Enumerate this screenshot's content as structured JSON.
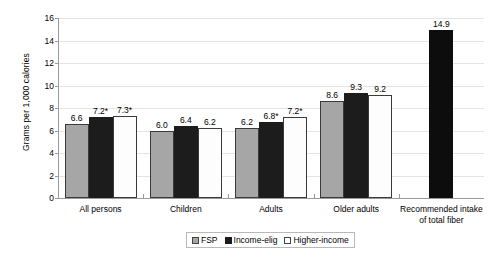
{
  "chart_data": {
    "type": "bar",
    "title": "",
    "xlabel": "",
    "ylabel": "Grams per 1,000 calories",
    "ylim": [
      0,
      16
    ],
    "yticks": [
      0,
      2,
      4,
      6,
      8,
      10,
      12,
      14,
      16
    ],
    "grid": true,
    "legend_position": "bottom-center",
    "categories": [
      "All persons",
      "Children",
      "Adults",
      "Older adults",
      "Recommended intake of total fiber"
    ],
    "series": [
      {
        "name": "FSP",
        "color": "#a6a6a6",
        "values": [
          6.6,
          6.0,
          6.2,
          8.6,
          null
        ],
        "labels": [
          "6.6",
          "6.0",
          "6.2",
          "8.6",
          ""
        ]
      },
      {
        "name": "Income-elig",
        "color": "#1c1c1c",
        "values": [
          7.2,
          6.4,
          6.8,
          9.3,
          null
        ],
        "labels": [
          "7.2*",
          "6.4",
          "6.8*",
          "9.3",
          ""
        ]
      },
      {
        "name": "Higher-income",
        "color": "#ffffff",
        "values": [
          7.3,
          6.2,
          7.2,
          9.2,
          null
        ],
        "labels": [
          "7.3*",
          "6.2",
          "7.2*",
          "9.2",
          ""
        ]
      },
      {
        "name": "Recommended",
        "color": "#0d0d0d",
        "values": [
          null,
          null,
          null,
          null,
          14.9
        ],
        "labels": [
          "",
          "",
          "",
          "",
          "14.9"
        ]
      }
    ],
    "annotations": [
      "* denotes statistically significant difference from FSP participants"
    ]
  },
  "yaxis": {
    "ticks": [
      "0",
      "2",
      "4",
      "6",
      "8",
      "10",
      "12",
      "14",
      "16"
    ],
    "label": "Grams per 1,000 calories"
  },
  "xaxis": {
    "categories": [
      {
        "line1": "All persons",
        "line2": ""
      },
      {
        "line1": "Children",
        "line2": ""
      },
      {
        "line1": "Adults",
        "line2": ""
      },
      {
        "line1": "Older adults",
        "line2": ""
      },
      {
        "line1": "Recommended intake",
        "line2": "of total fiber"
      }
    ]
  },
  "legend": {
    "items": [
      {
        "label": "FSP",
        "color": "#a6a6a6"
      },
      {
        "label": "Income-elig",
        "color": "#1c1c1c"
      },
      {
        "label": "Higher-income",
        "color": "#ffffff"
      }
    ]
  },
  "values": {
    "all_persons": {
      "fsp": "6.6",
      "income_elig": "7.2*",
      "higher_income": "7.3*"
    },
    "children": {
      "fsp": "6.0",
      "income_elig": "6.4",
      "higher_income": "6.2"
    },
    "adults": {
      "fsp": "6.2",
      "income_elig": "6.8*",
      "higher_income": "7.2*"
    },
    "older_adults": {
      "fsp": "8.6",
      "income_elig": "9.3",
      "higher_income": "9.2"
    },
    "recommended": {
      "value": "14.9"
    }
  },
  "caption": ""
}
